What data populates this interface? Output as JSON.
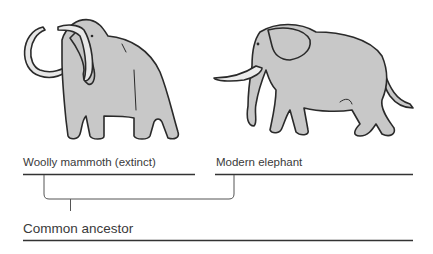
{
  "diagram": {
    "type": "evolutionary-tree",
    "species": [
      {
        "id": "mammoth",
        "label": "Woolly mammoth (extinct)",
        "illustration": "woolly-mammoth-illustration"
      },
      {
        "id": "elephant",
        "label": "Modern elephant",
        "illustration": "modern-elephant-illustration"
      }
    ],
    "ancestor": {
      "label": "Common ancestor"
    },
    "colors": {
      "body_fill": "#c8c8c8",
      "outline": "#2a2a2a",
      "tusk_fill": "#e8e8e8",
      "line": "#333333",
      "bracket": "#555555"
    }
  }
}
